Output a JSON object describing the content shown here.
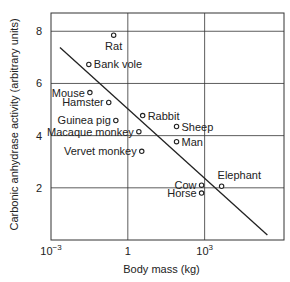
{
  "chart_data": {
    "type": "scatter",
    "title": "",
    "xlabel": "Body mass (kg)",
    "ylabel": "Carbonic anhydrase activity (arbitrary units)",
    "xscale": "log",
    "xlim_log10": [
      -3,
      6.1
    ],
    "ylim": [
      0,
      8.7
    ],
    "grid": true,
    "x_ticks": [
      {
        "log10": -3,
        "base": "10",
        "exp": "−3"
      },
      {
        "log10": 0,
        "base": "1",
        "exp": ""
      },
      {
        "log10": 3,
        "base": "10",
        "exp": "3"
      }
    ],
    "y_ticks": [
      {
        "value": 2,
        "label": "2"
      },
      {
        "value": 4,
        "label": "4"
      },
      {
        "value": 6,
        "label": "6"
      },
      {
        "value": 8,
        "label": "8"
      }
    ],
    "points": [
      {
        "name": "Rat",
        "mass_kg": 0.28,
        "activity": 7.85,
        "label_pos": "below"
      },
      {
        "name": "Bank vole",
        "mass_kg": 0.03,
        "activity": 6.73,
        "label_pos": "right"
      },
      {
        "name": "Mouse",
        "mass_kg": 0.033,
        "activity": 5.65,
        "label_pos": "left"
      },
      {
        "name": "Hamster",
        "mass_kg": 0.18,
        "activity": 5.27,
        "label_pos": "left"
      },
      {
        "name": "Guinea pig",
        "mass_kg": 0.34,
        "activity": 4.58,
        "label_pos": "left"
      },
      {
        "name": "Macaque monkey",
        "mass_kg": 2.7,
        "activity": 4.15,
        "label_pos": "left"
      },
      {
        "name": "Vervet monkey",
        "mass_kg": 3.5,
        "activity": 3.4,
        "label_pos": "left"
      },
      {
        "name": "Rabbit",
        "mass_kg": 3.8,
        "activity": 4.77,
        "label_pos": "right"
      },
      {
        "name": "Sheep",
        "mass_kg": 80,
        "activity": 4.35,
        "label_pos": "right"
      },
      {
        "name": "Man",
        "mass_kg": 80,
        "activity": 3.77,
        "label_pos": "right"
      },
      {
        "name": "Cow",
        "mass_kg": 760,
        "activity": 2.1,
        "label_pos": "left"
      },
      {
        "name": "Horse",
        "mass_kg": 760,
        "activity": 1.8,
        "label_pos": "left"
      },
      {
        "name": "Elephant",
        "mass_kg": 4600,
        "activity": 2.06,
        "label_pos": "above-right"
      }
    ],
    "fit_line": {
      "start": {
        "log10_mass": -2.65,
        "activity": 7.38
      },
      "end": {
        "log10_mass": 5.45,
        "activity": 0.19
      }
    }
  }
}
